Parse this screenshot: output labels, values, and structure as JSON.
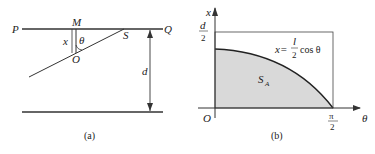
{
  "figure_a": {
    "caption": "(a)",
    "labels": {
      "P": "P",
      "Q": "Q",
      "M": "M",
      "S": "S",
      "O": "O",
      "x": "x",
      "theta": "θ",
      "d": "d"
    }
  },
  "figure_b": {
    "caption": "(b)",
    "axis_x_label": "θ",
    "axis_y_label": "x",
    "origin": "O",
    "y_tick_num": "d",
    "y_tick_den": "2",
    "x_tick_num": "π",
    "x_tick_den": "2",
    "curve_label_lhs": "x=",
    "curve_label_num": "l",
    "curve_label_den": "2",
    "curve_label_rhs": "cos θ",
    "region_label": "S",
    "region_sub": "A",
    "fill_color": "#d9d9d9"
  }
}
